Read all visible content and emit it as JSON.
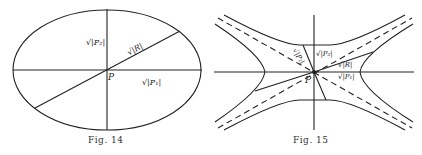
{
  "figures": [
    {
      "caption": "Fig. 14",
      "shape": "ellipse",
      "labels": {
        "point": "P",
        "vertical_axis": "√|P₂|",
        "diagonal": "√|R|",
        "horizontal_axis": "√|P₁|"
      }
    },
    {
      "caption": "Fig. 15",
      "shape": "hyperbolas with asymptotes",
      "labels": {
        "point": "P",
        "upper_left": "√|P₂|",
        "upper_vertical": "√|P₂|",
        "right_upper": "√|R|",
        "right_lower": "√|P₁|"
      }
    }
  ]
}
